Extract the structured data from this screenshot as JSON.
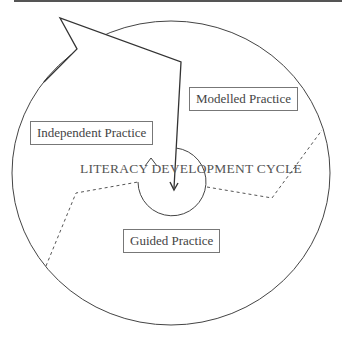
{
  "diagram": {
    "title": "LITERACY DEVELOPMENT CYCLE",
    "stages": [
      {
        "label": "Modelled Practice"
      },
      {
        "label": "Independent Practice"
      },
      {
        "label": "Guided Practice"
      }
    ],
    "colors": {
      "line": "#333333",
      "dashed": "#555555",
      "text": "#444444",
      "box_border": "#777777",
      "top_rule": "#555555"
    }
  }
}
